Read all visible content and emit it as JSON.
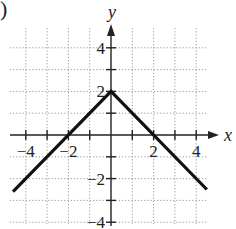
{
  "label_prefix": ")",
  "chart_data": {
    "type": "line",
    "title": "",
    "xlabel": "x",
    "ylabel": "y",
    "xlim": [
      -4.5,
      4.5
    ],
    "ylim": [
      -4,
      4.8
    ],
    "grid": true,
    "x_ticks": [
      -4,
      -3,
      -2,
      -1,
      1,
      2,
      3,
      4
    ],
    "y_ticks": [
      -4,
      -3,
      -2,
      -1,
      1,
      2,
      3,
      4
    ],
    "x_tick_labels": [
      "-4",
      "-2",
      "2",
      "4"
    ],
    "y_tick_labels": [
      "4",
      "2",
      "-2",
      "-4"
    ],
    "series": [
      {
        "name": "y = -|x| + 2",
        "x": [
          -4.6,
          0,
          4.5
        ],
        "y": [
          -2.6,
          2,
          -2.5
        ]
      }
    ]
  }
}
